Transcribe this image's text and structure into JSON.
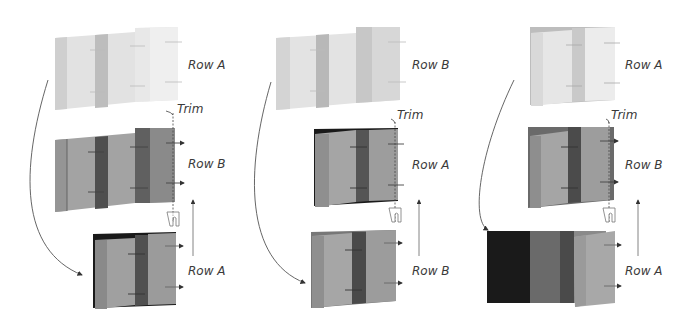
{
  "diagram": {
    "columns": [
      {
        "id": "col-1",
        "top_label": "Row A",
        "middle_label": "Row B",
        "bottom_label": "Row A",
        "trim_label": "Trim"
      },
      {
        "id": "col-2",
        "top_label": "Row B",
        "middle_label": "Row A",
        "bottom_label": "Row B",
        "trim_label": "Trim"
      },
      {
        "id": "col-3",
        "top_label": "Row A",
        "middle_label": "Row B",
        "bottom_label": "Row A",
        "trim_label": "Trim"
      }
    ],
    "colors": {
      "light_panel": "#e6e6e6",
      "light_stripe": "#c4c4c4",
      "mid_panel": "#9d9d9d",
      "mid_dark_stripe": "#5a5a5a",
      "dark": "#1a1a1a",
      "arrow": "#555555"
    }
  }
}
